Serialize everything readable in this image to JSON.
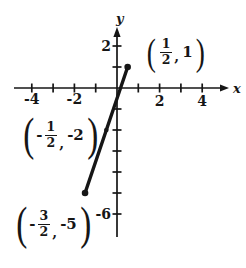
{
  "colors": {
    "ink": "#161616",
    "background": "#ffffff"
  },
  "chart_data": {
    "type": "line",
    "title": "",
    "xlabel": "x",
    "ylabel": "y",
    "xlim": [
      -4.8,
      5.1
    ],
    "ylim": [
      -7.3,
      3.2
    ],
    "grid": false,
    "x_ticks": [
      -4,
      -3,
      -2,
      -1,
      1,
      2,
      3,
      4
    ],
    "x_tick_labels": [
      {
        "value": -4,
        "text": "-4"
      },
      {
        "value": -2,
        "text": "-2"
      },
      {
        "value": 2,
        "text": "2"
      },
      {
        "value": 4,
        "text": "4"
      }
    ],
    "y_ticks": [
      2,
      1,
      -1,
      -2,
      -3,
      -4,
      -5,
      -6
    ],
    "y_tick_labels": [
      {
        "value": 2,
        "text": "2"
      },
      {
        "value": -6,
        "text": "-6"
      }
    ],
    "series": [
      {
        "name": "segment",
        "points": [
          [
            -1.5,
            -5
          ],
          [
            -0.5,
            -2
          ],
          [
            0.5,
            1
          ]
        ],
        "endpoint_marker_radius": 3.3,
        "midpoint_marker_radius": 2.3
      }
    ],
    "annotations": [
      "(1/2, 1)",
      "(-1/2, -2)",
      "(-3/2, -5)"
    ]
  },
  "labels": {
    "open_paren": "(",
    "close_paren": ")",
    "comma": ",",
    "points": [
      {
        "x_sign": "",
        "num": "1",
        "den": "2",
        "y_val": "1"
      },
      {
        "x_sign": "-",
        "num": "1",
        "den": "2",
        "y_val": "-2"
      },
      {
        "x_sign": "-",
        "num": "3",
        "den": "2",
        "y_val": "-5"
      }
    ]
  }
}
